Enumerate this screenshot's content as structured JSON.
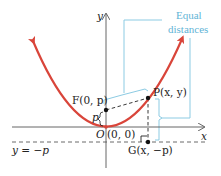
{
  "diagram": {
    "colors": {
      "parabola": "#d9453a",
      "axes": "#555555",
      "bracket": "#8ccbe3",
      "annotation_text": "#5fb4d6",
      "points": "#111111"
    },
    "axes": {
      "x_label": "x",
      "y_label": "y"
    },
    "points": {
      "focus": "F(0, p)",
      "point": "P(x, y)",
      "origin_letter": "O",
      "origin_coords": "(0, 0)",
      "directrix_point": "G(x, −p)"
    },
    "focus_distance_label": "p",
    "directrix_label": "y = −p",
    "annotation": {
      "line1": "Equal",
      "line2": "distances"
    }
  }
}
